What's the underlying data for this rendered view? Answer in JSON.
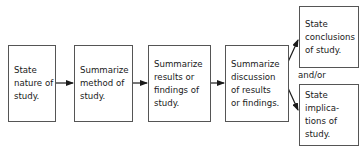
{
  "diagram": {
    "type": "flowchart",
    "nodes": [
      {
        "id": "n1",
        "text": "State\nnature of\nstudy."
      },
      {
        "id": "n2",
        "text": "Summarize\nmethod of\nstudy."
      },
      {
        "id": "n3",
        "text": "Summarize\nresults or\nfindings of\nstudy."
      },
      {
        "id": "n4",
        "text": "Summarize\ndiscussion\nof results\nor findings."
      },
      {
        "id": "n5",
        "text": "State\nconclusions\nof study."
      },
      {
        "id": "n6",
        "text": "State\nimplica-\ntions of\nstudy."
      }
    ],
    "edges": [
      {
        "from": "n1",
        "to": "n2"
      },
      {
        "from": "n2",
        "to": "n3"
      },
      {
        "from": "n3",
        "to": "n4"
      },
      {
        "from": "n4",
        "to": "n5"
      },
      {
        "from": "n4",
        "to": "n6"
      }
    ],
    "connector_label": "and/or",
    "colors": {
      "border": "#555555",
      "arrow": "#1a1a1a",
      "text": "#1a1a1a"
    }
  }
}
